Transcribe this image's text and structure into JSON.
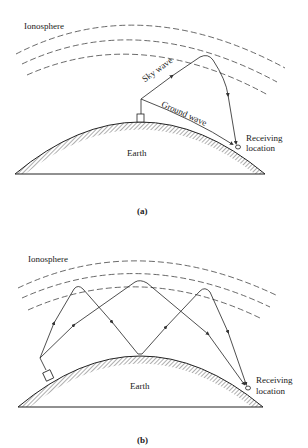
{
  "panel_a": {
    "ionosphere_label": "Ionosphere",
    "sky_wave_label": "Sky wave",
    "ground_wave_label": "Ground wave",
    "earth_label": "Earth",
    "receiving_label_line1": "Receiving",
    "receiving_label_line2": "location",
    "caption": "(a)"
  },
  "panel_b": {
    "ionosphere_label": "Ionosphere",
    "earth_label": "Earth",
    "receiving_label_line1": "Receiving",
    "receiving_label_line2": "location",
    "caption": "(b)"
  },
  "colors": {
    "line": "#333333",
    "background": "#ffffff"
  }
}
